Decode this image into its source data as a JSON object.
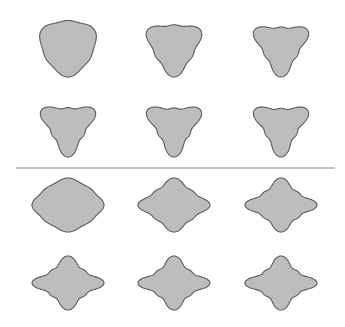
{
  "figure": {
    "title": "",
    "colors": {
      "fill": "#bdbdbd",
      "stroke": "#5a5a5a",
      "divider": "#8a8a8a",
      "background": "#ffffff"
    },
    "sections": [
      {
        "name": "three-lobed",
        "lobes": 3,
        "orientation": "point-down",
        "shapes": [
          {
            "amplitude": 0.1
          },
          {
            "amplitude": 0.2
          },
          {
            "amplitude": 0.26
          },
          {
            "amplitude": 0.28
          },
          {
            "amplitude": 0.29
          },
          {
            "amplitude": 0.3
          }
        ]
      },
      {
        "name": "four-lobed",
        "lobes": 4,
        "orientation": "axis-aligned",
        "shapes": [
          {
            "amplitude": 0.07
          },
          {
            "amplitude": 0.16
          },
          {
            "amplitude": 0.21
          },
          {
            "amplitude": 0.22
          },
          {
            "amplitude": 0.23
          },
          {
            "amplitude": 0.24
          }
        ]
      }
    ]
  }
}
